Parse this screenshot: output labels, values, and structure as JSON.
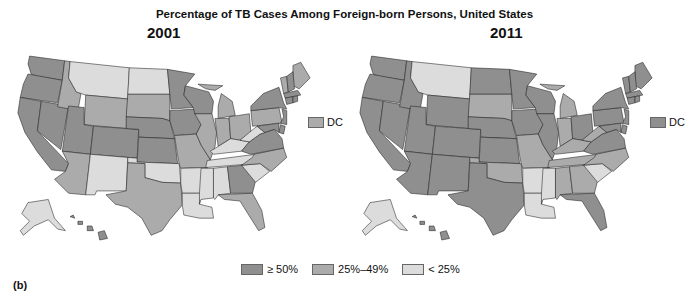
{
  "title": "Percentage of TB Cases Among Foreign-born Persons, United States",
  "panel_label": "(b)",
  "colors": {
    "high": "#8f8f8f",
    "mid": "#ababab",
    "low": "#dcdcdc"
  },
  "legend": [
    {
      "key": "high",
      "label": "≥ 50%"
    },
    {
      "key": "mid",
      "label": "25%–49%"
    },
    {
      "key": "low",
      "label": "< 25%"
    }
  ],
  "dc_label": "DC",
  "maps": [
    {
      "year": "2001",
      "dc": "mid",
      "states": {
        "WA": "high",
        "OR": "high",
        "CA": "high",
        "NV": "high",
        "ID": "mid",
        "MT": "low",
        "WY": "mid",
        "UT": "high",
        "CO": "high",
        "AZ": "mid",
        "NM": "low",
        "ND": "low",
        "SD": "mid",
        "NE": "high",
        "KS": "high",
        "OK": "low",
        "TX": "mid",
        "MN": "high",
        "IA": "high",
        "MO": "mid",
        "AR": "low",
        "LA": "low",
        "WI": "high",
        "IL": "mid",
        "MI": "mid",
        "IN": "mid",
        "OH": "mid",
        "KY": "low",
        "TN": "low",
        "MS": "low",
        "AL": "low",
        "GA": "high",
        "FL": "mid",
        "SC": "low",
        "NC": "mid",
        "VA": "high",
        "WV": "low",
        "PA": "mid",
        "NY": "high",
        "ME": "mid",
        "VT": "mid",
        "NH": "high",
        "MA": "high",
        "CT": "high",
        "RI": "high",
        "NJ": "high",
        "DE": "high",
        "MD": "high",
        "AK": "low",
        "HI": "high"
      }
    },
    {
      "year": "2011",
      "dc": "high",
      "states": {
        "WA": "high",
        "OR": "high",
        "CA": "high",
        "NV": "high",
        "ID": "high",
        "MT": "low",
        "WY": "high",
        "UT": "high",
        "CO": "high",
        "AZ": "high",
        "NM": "high",
        "ND": "high",
        "SD": "mid",
        "NE": "high",
        "KS": "high",
        "OK": "mid",
        "TX": "high",
        "MN": "high",
        "IA": "high",
        "MO": "mid",
        "AR": "low",
        "LA": "low",
        "WI": "high",
        "IL": "high",
        "MI": "mid",
        "IN": "mid",
        "OH": "high",
        "KY": "mid",
        "TN": "mid",
        "MS": "low",
        "AL": "mid",
        "GA": "mid",
        "FL": "high",
        "SC": "low",
        "NC": "mid",
        "VA": "high",
        "WV": "mid",
        "PA": "high",
        "NY": "high",
        "ME": "high",
        "VT": "high",
        "NH": "high",
        "MA": "high",
        "CT": "high",
        "RI": "high",
        "NJ": "high",
        "DE": "high",
        "MD": "high",
        "AK": "low",
        "HI": "high"
      }
    }
  ],
  "chart_data": {
    "type": "choropleth",
    "title": "Percentage of TB Cases Among Foreign-born Persons, United States",
    "categories": [
      "≥ 50%",
      "25%–49%",
      "< 25%"
    ],
    "panels": [
      "2001",
      "2011"
    ]
  }
}
